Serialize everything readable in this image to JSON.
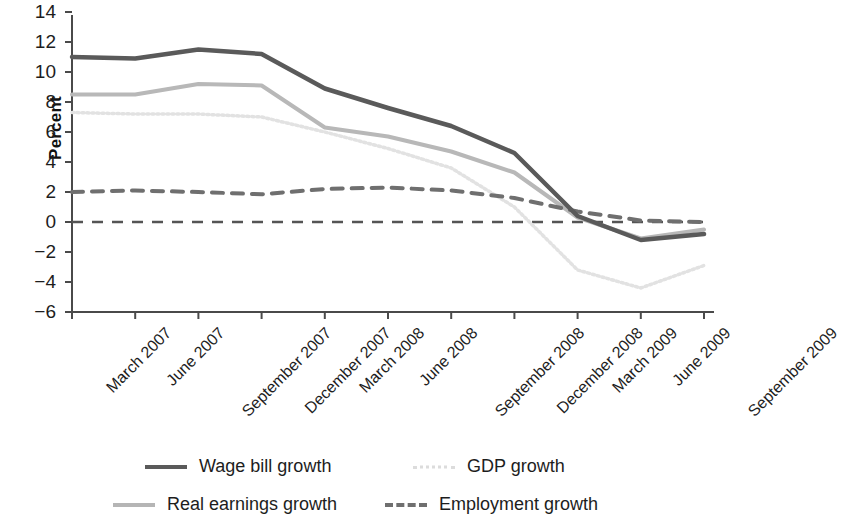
{
  "chart_data": {
    "type": "line",
    "title": "",
    "subtitle": "",
    "xlabel": "",
    "ylabel": "Percent",
    "ylim": [
      -6,
      14
    ],
    "yticks": [
      14,
      12,
      10,
      8,
      6,
      4,
      2,
      0,
      -2,
      -4,
      -6
    ],
    "ytick_labels": [
      "14",
      "12",
      "10",
      "8",
      "6",
      "4",
      "2",
      "0",
      "−2",
      "−4",
      "−6"
    ],
    "grid": false,
    "legend_position": "bottom",
    "categories": [
      "March 2007",
      "June 2007",
      "September 2007",
      "December 2007",
      "March 2008",
      "June 2008",
      "September 2008",
      "December 2008",
      "March 2009",
      "June 2009",
      "September 2009"
    ],
    "zero_line": 0,
    "series": [
      {
        "name": "Wage bill growth",
        "style": "solid",
        "color": "#5a5a5a",
        "width": 4.5,
        "values": [
          11.0,
          10.9,
          11.5,
          11.2,
          8.9,
          7.6,
          6.4,
          4.6,
          0.4,
          -1.2,
          -0.8
        ]
      },
      {
        "name": "Real earnings growth",
        "style": "solid",
        "color": "#b8b8b8",
        "width": 4.0,
        "values": [
          8.5,
          8.5,
          9.2,
          9.1,
          6.3,
          5.7,
          4.7,
          3.3,
          0.3,
          -1.1,
          -0.5
        ]
      },
      {
        "name": "GDP growth",
        "style": "dotted",
        "color": "#e2e2e2",
        "width": 3.5,
        "values": [
          7.3,
          7.2,
          7.2,
          7.0,
          6.0,
          4.9,
          3.6,
          1.0,
          -3.2,
          -4.4,
          -2.9
        ]
      },
      {
        "name": "Employment growth",
        "style": "dashed",
        "color": "#6f6f6f",
        "width": 4.0,
        "values": [
          2.0,
          2.1,
          2.0,
          1.85,
          2.2,
          2.3,
          2.1,
          1.6,
          0.7,
          0.1,
          0.0
        ]
      }
    ]
  },
  "axis": {
    "y_title": "Percent",
    "y_tick_labels": [
      "14",
      "12",
      "10",
      "8",
      "6",
      "4",
      "2",
      "0",
      "−2",
      "−4",
      "−6"
    ],
    "x_tick_labels": [
      "March 2007",
      "June 2007",
      "September 2007",
      "December 2007",
      "March 2008",
      "June 2008",
      "September 2008",
      "December 2008",
      "March 2009",
      "June 2009",
      "September 2009"
    ]
  },
  "legend": {
    "items": [
      {
        "label": "Wage bill growth",
        "swatch": "solid-dark"
      },
      {
        "label": "GDP growth",
        "swatch": "dotted-light"
      },
      {
        "label": "Real earnings growth",
        "swatch": "solid-mid"
      },
      {
        "label": "Employment growth",
        "swatch": "dashed-gray"
      }
    ]
  },
  "colors": {
    "wage_bill": "#5a5a5a",
    "real_earnings": "#b8b8b8",
    "gdp": "#e2e2e2",
    "employment": "#6f6f6f",
    "axis": "#4a4a4a",
    "text": "#1d1d1d"
  }
}
